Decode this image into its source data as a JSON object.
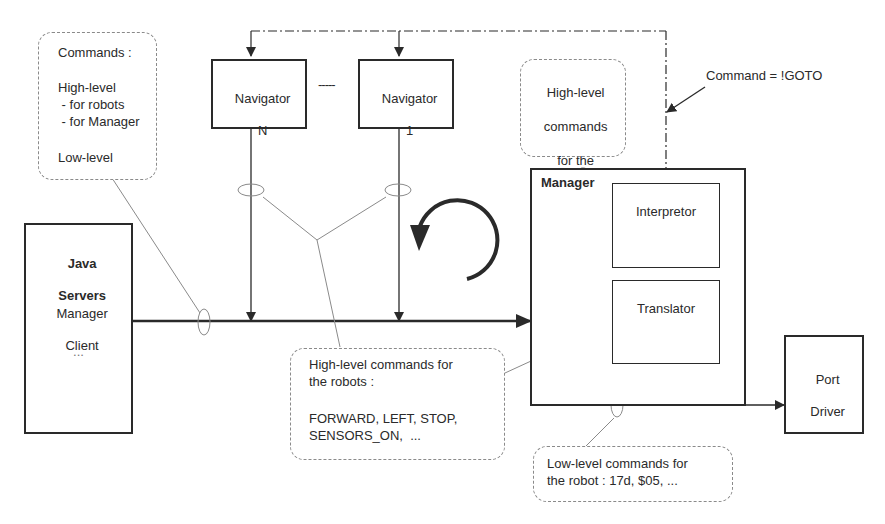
{
  "diagram": {
    "callouts": {
      "commands": {
        "title": "Commands :",
        "line1": "High-level",
        "line2": " - for robots",
        "line3": " - for Manager",
        "line4": "Low-level"
      },
      "manager_commands": {
        "line1": "High-level",
        "line2": "commands",
        "line3": "for the",
        "line4": "Manager"
      },
      "robot_commands": {
        "line1": "High-level commands for",
        "line2": "the robots :",
        "line3": "FORWARD, LEFT, STOP,",
        "line4": "SENSORS_ON,  ..."
      },
      "low_level": {
        "line1": "Low-level commands for",
        "line2": "the robot : 17d, $05, ..."
      }
    },
    "annotation": {
      "goto": "Command = !GOTO"
    },
    "nodes": {
      "navigator_n": {
        "line1": "Navigator",
        "line2": "N"
      },
      "navigator_1": {
        "line1": "Navigator",
        "line2": "1"
      },
      "navigator_ellipsis": "-----",
      "java_servers": {
        "title1": "Java",
        "title2": "Servers",
        "line1": "Manager",
        "line2": "Client",
        "more": "..."
      },
      "manager": {
        "title": "Manager"
      },
      "interpretor": {
        "label": "Interpretor"
      },
      "translator": {
        "label": "Translator"
      },
      "port_driver": {
        "line1": "Port",
        "line2": "Driver"
      }
    },
    "colors": {
      "stroke": "#2a2a2a",
      "callout_stroke": "#8a8a8a",
      "background": "#ffffff"
    }
  }
}
